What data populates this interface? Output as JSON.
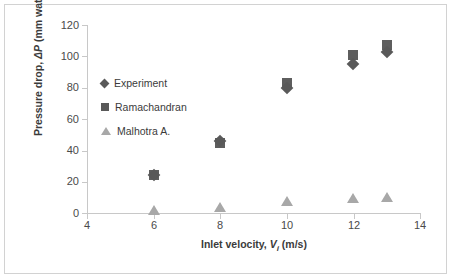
{
  "chart_data": {
    "type": "scatter",
    "title": "",
    "xlabel": "Inlet velocity, Vᵢ (m/s)",
    "xlabel_parts": {
      "prefix": "Inlet velocity, ",
      "symbol": "V",
      "subscript": "i",
      "suffix": " (m/s)"
    },
    "ylabel": "Pressure drop, ΔP (mm water)",
    "ylabel_parts": {
      "prefix": "Pressure drop, ",
      "symbol": "ΔP",
      "suffix": " (mm water)"
    },
    "xlim": [
      4,
      14
    ],
    "ylim": [
      0,
      120
    ],
    "xticks": [
      4,
      6,
      8,
      10,
      12,
      14
    ],
    "yticks": [
      0,
      20,
      40,
      60,
      80,
      100,
      120
    ],
    "grid": false,
    "legend_position": "upper-left-inside",
    "x": [
      6,
      8,
      10,
      12,
      13
    ],
    "series": [
      {
        "name": "Experiment",
        "marker": "diamond",
        "color": "#595959",
        "values": [
          24,
          46,
          80,
          95,
          103
        ]
      },
      {
        "name": "Ramachandran",
        "marker": "square",
        "color": "#5e5e5e",
        "values": [
          24,
          45,
          83,
          101,
          107
        ]
      },
      {
        "name": "Malhotra A.",
        "marker": "triangle",
        "color": "#a8a8a8",
        "values": [
          1,
          3,
          7,
          9,
          9.5
        ]
      }
    ]
  },
  "frame": {
    "border_color": "#d2d2d2",
    "background": "#ffffff"
  },
  "axis_style": {
    "line_color": "#c8c8c8",
    "tick_label_color": "#4a4a4a",
    "title_color": "#3b3b3b"
  }
}
